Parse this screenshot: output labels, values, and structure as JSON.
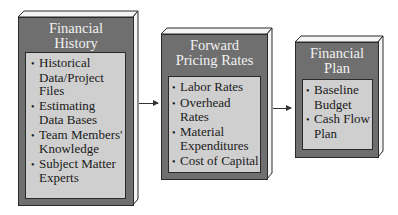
{
  "diagram": {
    "boxes": [
      {
        "title_lines": [
          "Financial",
          "History"
        ],
        "items": [
          "Historical Data/Project Files",
          "Estimating Data Bases",
          "Team Members' Knowledge",
          "Subject Matter Experts"
        ]
      },
      {
        "title_lines": [
          "Forward",
          "Pricing Rates"
        ],
        "items": [
          "Labor Rates",
          "Overhead Rates",
          "Material Expenditures",
          "Cost of Capital"
        ]
      },
      {
        "title_lines": [
          "Financial",
          "Plan"
        ],
        "items": [
          "Baseline Budget",
          "Cash Flow Plan"
        ]
      }
    ],
    "arrows": [
      {
        "from": "Financial History",
        "to": "Forward Pricing Rates"
      },
      {
        "from": "Forward Pricing Rates",
        "to": "Financial Plan"
      }
    ],
    "colors": {
      "box_face": "#6f6f6f",
      "inner_panel": "#cfcfcf",
      "edge_highlight": "#f4f4f4",
      "outline": "#2a2a2a"
    }
  }
}
